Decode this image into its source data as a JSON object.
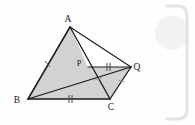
{
  "figure": {
    "background_color": "#fefefe",
    "stroke_color": "#1a1a1a",
    "shade_color": "#d2d2d2",
    "decoration_color": "#e8e8e8",
    "labels": {
      "A": "A",
      "B": "B",
      "C": "C",
      "P": "P",
      "Q": "Q"
    },
    "points": {
      "A": {
        "x": 70,
        "y": 27
      },
      "B": {
        "x": 28,
        "y": 99
      },
      "C": {
        "x": 110,
        "y": 99
      },
      "P": {
        "x": 88,
        "y": 67
      },
      "Q": {
        "x": 131,
        "y": 67
      }
    },
    "label_positions": {
      "A": {
        "x": 68,
        "y": 22
      },
      "B": {
        "x": 17,
        "y": 103
      },
      "C": {
        "x": 111,
        "y": 110
      },
      "P": {
        "x": 79,
        "y": 65
      },
      "Q": {
        "x": 136,
        "y": 70
      }
    },
    "segments": [
      {
        "name": "AB",
        "from": "A",
        "to": "B"
      },
      {
        "name": "BC",
        "from": "B",
        "to": "C"
      },
      {
        "name": "CA",
        "from": "C",
        "to": "A"
      },
      {
        "name": "AQ",
        "from": "A",
        "to": "Q"
      },
      {
        "name": "BQ",
        "from": "B",
        "to": "Q"
      },
      {
        "name": "PQ",
        "from": "P",
        "to": "Q"
      },
      {
        "name": "CQ",
        "from": "C",
        "to": "Q"
      }
    ],
    "shaded_regions": [
      {
        "name": "region-ABP-C",
        "vertices": "A,B,C"
      },
      {
        "name": "region-PCQ",
        "vertices": "P,C,Q"
      }
    ],
    "tick_marks": [
      {
        "name": "tick-AB",
        "count": 1,
        "on": "AB"
      },
      {
        "name": "tick-BC",
        "count": 2,
        "on": "BC"
      },
      {
        "name": "tick-PQ",
        "count": 2,
        "on": "PQ"
      },
      {
        "name": "tick-PC",
        "count": 1,
        "on": "PC"
      },
      {
        "name": "tick-CQ",
        "count": 1,
        "on": "CQ"
      }
    ],
    "decorations": {
      "bracket_label": "right-rounded-bracket",
      "watermark_label": "faint-circle-watermark"
    }
  }
}
